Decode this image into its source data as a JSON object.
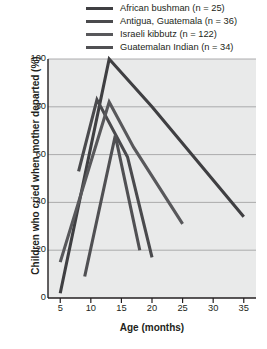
{
  "chart_data": {
    "type": "line",
    "title": "",
    "xlabel": "Age (months)",
    "ylabel": "Children who cried when mother departed (%)",
    "xlim": [
      3,
      37
    ],
    "ylim": [
      0,
      100
    ],
    "xticks": [
      5,
      10,
      15,
      20,
      25,
      30,
      35
    ],
    "yticks": [
      0,
      20,
      40,
      60,
      80,
      100
    ],
    "grid": "horizontal",
    "legend_position": "top-right",
    "plot_background": "#e9eaea",
    "series": [
      {
        "name": "African bushman",
        "n": 25,
        "legend_label": "African bushman (n = 25)",
        "color": "#3f3f42",
        "x": [
          5,
          13,
          20,
          35
        ],
        "y": [
          2,
          100,
          80,
          34
        ]
      },
      {
        "name": "Antigua, Guatemala",
        "n": 36,
        "legend_label": "Antigua, Guatemala (n = 36)",
        "color": "#4a4a4d",
        "x": [
          8,
          11,
          16,
          20
        ],
        "y": [
          53,
          83,
          59,
          17
        ]
      },
      {
        "name": "Israeli kibbutz",
        "n": 122,
        "legend_label": "Israeli kibbutz (n = 122)",
        "color": "#58585b",
        "x": [
          5,
          13,
          17,
          25
        ],
        "y": [
          15,
          82,
          63,
          31
        ]
      },
      {
        "name": "Guatemalan Indian",
        "n": 34,
        "legend_label": "Guatemalan Indian (n = 34)",
        "color": "#505053",
        "x": [
          9,
          14,
          18
        ],
        "y": [
          9,
          68,
          20
        ]
      }
    ]
  },
  "legend": {
    "items": [
      {
        "label": "African bushman (n = 25)",
        "color": "#3f3f42"
      },
      {
        "label": "Antigua, Guatemala (n = 36)",
        "color": "#4a4a4d"
      },
      {
        "label": "Israeli kibbutz (n = 122)",
        "color": "#58585b"
      },
      {
        "label": "Guatemalan Indian (n = 34)",
        "color": "#505053"
      }
    ]
  },
  "axes": {
    "y": {
      "label": "Children who cried when mother departed (%)",
      "ticks": [
        "100",
        "80",
        "60",
        "40",
        "20",
        "0"
      ]
    },
    "x": {
      "label": "Age (months)",
      "ticks": [
        "5",
        "10",
        "15",
        "20",
        "25",
        "30",
        "35"
      ]
    }
  }
}
